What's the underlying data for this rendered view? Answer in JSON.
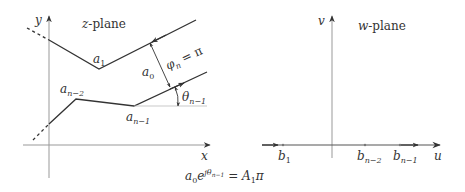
{
  "z_plane": {
    "title_var": "z",
    "title_rest": "-plane",
    "axis_x_label": "x",
    "axis_y_label": "y",
    "vertex_a1": "a",
    "vertex_a1_sub": "1",
    "vertex_an2": "a",
    "vertex_an2_sub": "n−2",
    "vertex_an1": "a",
    "vertex_an1_sub": "n−1",
    "width_label": "a",
    "width_label_sub": "0",
    "phi_label": "φ",
    "phi_sub": "n",
    "phi_value": " = π",
    "theta_label": "θ",
    "theta_sub": "n−1"
  },
  "w_plane": {
    "title_var": "w",
    "title_rest": "-plane",
    "axis_u_label": "u",
    "axis_v_label": "v",
    "points": [
      {
        "label": "b",
        "sub": "1"
      },
      {
        "label": "b",
        "sub": "n−2"
      },
      {
        "label": "b",
        "sub": "n−1"
      }
    ]
  },
  "equation": {
    "lhs_base": "a",
    "lhs_base_sub": "0",
    "lhs_e": "e",
    "lhs_exp": "jθ",
    "lhs_exp_sub": "n−1",
    "eq": " = ",
    "rhs": "A",
    "rhs_sub": "1",
    "rhs_pi": "π"
  },
  "colors": {
    "stroke": "#333333",
    "axis": "#999999",
    "text": "#333333"
  }
}
